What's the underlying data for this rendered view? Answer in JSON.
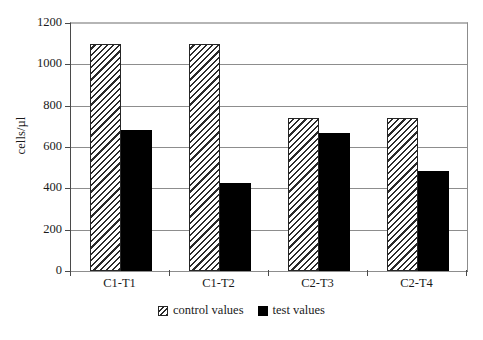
{
  "chart_data": {
    "type": "bar",
    "title": "",
    "xlabel": "",
    "ylabel": "cells/µl",
    "categories": [
      "C1-T1",
      "C1-T2",
      "C2-T3",
      "C2-T4"
    ],
    "series": [
      {
        "name": "control values",
        "values": [
          1100,
          1100,
          740,
          740
        ],
        "fill": "hatched-diagonal",
        "color": "#2b2b2b"
      },
      {
        "name": "test values",
        "values": [
          680,
          425,
          670,
          485
        ],
        "fill": "solid",
        "color": "#000000"
      }
    ],
    "ylim": [
      0,
      1200
    ],
    "ytick_values": [
      0,
      200,
      400,
      600,
      800,
      1000,
      1200
    ],
    "ytick_labels": [
      "0",
      "200",
      "400",
      "600",
      "800",
      "1000",
      "1200"
    ],
    "grid": "horizontal",
    "legend_position": "bottom-center"
  },
  "legend": {
    "entries": [
      {
        "label": "control values",
        "swatch": "hatched-swatch"
      },
      {
        "label": "test values",
        "swatch": "solid-black-swatch"
      }
    ]
  }
}
